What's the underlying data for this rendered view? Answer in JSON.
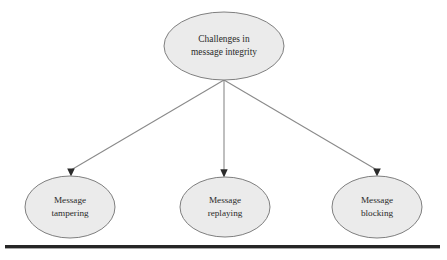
{
  "diagram": {
    "type": "hierarchy-tree",
    "background_color": "#ffffff",
    "node_fill_color": "#ebebeb",
    "node_stroke_color": "#7f7f7f",
    "connector_color": "#8a8a8a",
    "text_color": "#2a2a2a",
    "rule_color": "#262626",
    "root": {
      "label_line1": "Challenges in",
      "label_line2": "message integrity"
    },
    "children": [
      {
        "label_line1": "Message",
        "label_line2": "tampering"
      },
      {
        "label_line1": "Message",
        "label_line2": "replaying"
      },
      {
        "label_line1": "Message",
        "label_line2": "blocking"
      }
    ]
  }
}
